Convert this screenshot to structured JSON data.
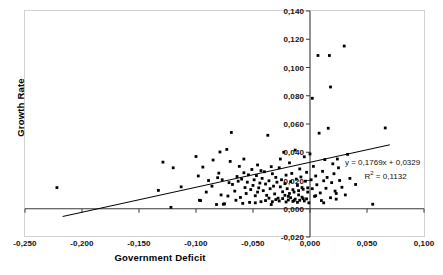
{
  "chart_data": {
    "type": "scatter",
    "title": "",
    "xlabel": "Government Deficit",
    "ylabel": "Growth Rate",
    "xlim": [
      -0.25,
      0.1
    ],
    "ylim": [
      -0.02,
      0.14
    ],
    "grid": false,
    "legend": "none",
    "x_ticks": [
      "-0,250",
      "-0,200",
      "-0,150",
      "-0,100",
      "-0,050",
      "0,000",
      "0,050",
      "0,100"
    ],
    "x_tick_values": [
      -0.25,
      -0.2,
      -0.15,
      -0.1,
      -0.05,
      0.0,
      0.05,
      0.1
    ],
    "y_ticks": [
      "0,140",
      "0,120",
      "0,100",
      "0,080",
      "0,060",
      "0,040",
      "0,020",
      "0,000",
      "-0,020"
    ],
    "y_tick_values": [
      0.14,
      0.12,
      0.1,
      0.08,
      0.06,
      0.04,
      0.02,
      0.0,
      -0.02
    ],
    "annotations": {
      "equation": "y = 0,1769x + 0,0329",
      "r_squared_prefix": "R",
      "r_squared_exp": "2",
      "r_squared_value": " = 0,1132"
    },
    "trendline": {
      "type": "linear",
      "slope": 0.1769,
      "intercept": 0.0329,
      "r2": 0.1132,
      "x_start": -0.217,
      "x_end": 0.07
    },
    "series": [
      {
        "name": "Countries",
        "marker": "square",
        "color": "#000000",
        "points": [
          [
            -0.222,
            0.015
          ],
          [
            -0.133,
            0.013
          ],
          [
            -0.129,
            0.033
          ],
          [
            -0.122,
            0.001
          ],
          [
            -0.12,
            0.029
          ],
          [
            -0.113,
            0.0155
          ],
          [
            -0.1,
            0.037
          ],
          [
            -0.098,
            0.0232
          ],
          [
            -0.097,
            0.006
          ],
          [
            -0.096,
            0.0058
          ],
          [
            -0.089,
            0.02
          ],
          [
            -0.086,
            0.016
          ],
          [
            -0.082,
            0.003
          ],
          [
            -0.081,
            0.022
          ],
          [
            -0.079,
            0.0402
          ],
          [
            -0.078,
            0.0098
          ],
          [
            -0.077,
            0.0205
          ],
          [
            -0.075,
            0.0035
          ],
          [
            -0.073,
            0.042
          ],
          [
            -0.072,
            0.009
          ],
          [
            -0.071,
            0.0185
          ],
          [
            -0.069,
            0.054
          ],
          [
            -0.068,
            0.0172
          ],
          [
            -0.066,
            0.0125
          ],
          [
            -0.065,
            0.006
          ],
          [
            -0.063,
            0.0195
          ],
          [
            -0.062,
            0.03
          ],
          [
            -0.061,
            0.008
          ],
          [
            -0.06,
            0.021
          ],
          [
            -0.059,
            0.0038
          ],
          [
            -0.058,
            0.0255
          ],
          [
            -0.057,
            0.015
          ],
          [
            -0.056,
            0.0108
          ],
          [
            -0.055,
            0.0188
          ],
          [
            -0.054,
            0.024
          ],
          [
            -0.053,
            0.0045
          ],
          [
            -0.052,
            0.0136
          ],
          [
            -0.051,
            0.0278
          ],
          [
            -0.05,
            0.0165
          ],
          [
            -0.049,
            0.0205
          ],
          [
            -0.048,
            0.0092
          ],
          [
            -0.047,
            0.0235
          ],
          [
            -0.046,
            0.031
          ],
          [
            -0.045,
            0.0148
          ],
          [
            -0.044,
            0.0182
          ],
          [
            -0.043,
            0.005
          ],
          [
            -0.042,
            0.0215
          ],
          [
            -0.041,
            0.0128
          ],
          [
            -0.04,
            0.0262
          ],
          [
            -0.039,
            0.0175
          ],
          [
            -0.038,
            0.0095
          ],
          [
            -0.037,
            0.052
          ],
          [
            -0.036,
            0.0198
          ],
          [
            -0.035,
            0.0142
          ],
          [
            -0.034,
            0.003
          ],
          [
            -0.033,
            0.0248
          ],
          [
            -0.032,
            0.016
          ],
          [
            -0.031,
            0.0105
          ],
          [
            -0.03,
            0.0222
          ],
          [
            -0.029,
            0.0188
          ],
          [
            -0.028,
            0.0075
          ],
          [
            -0.027,
            0.029
          ],
          [
            -0.026,
            0.0155
          ],
          [
            -0.025,
            0.0205
          ],
          [
            -0.024,
            0.012
          ],
          [
            -0.023,
            0.04
          ],
          [
            -0.022,
            0.0178
          ],
          [
            -0.021,
            0.0238
          ],
          [
            -0.02,
            0.0142
          ],
          [
            -0.019,
            0.0088
          ],
          [
            -0.018,
            0.0325
          ],
          [
            -0.017,
            0.0192
          ],
          [
            -0.016,
            0.025
          ],
          [
            -0.015,
            0.0135
          ],
          [
            -0.014,
            0.0058
          ],
          [
            -0.013,
            0.0415
          ],
          [
            -0.012,
            0.021
          ],
          [
            -0.011,
            0.0165
          ],
          [
            -0.01,
            0.0098
          ],
          [
            -0.009,
            0.0282
          ],
          [
            -0.008,
            0.0225
          ],
          [
            -0.007,
            0.015
          ],
          [
            -0.006,
            0.0072
          ],
          [
            -0.005,
            0.0368
          ],
          [
            -0.004,
            0.0195
          ],
          [
            -0.003,
            0.0258
          ],
          [
            -0.002,
            0.0118
          ],
          [
            -0.001,
            0.0042
          ],
          [
            0.0,
            0.0388
          ],
          [
            0.001,
            0.0205
          ],
          [
            0.002,
            0.0142
          ],
          [
            0.003,
            0.03
          ],
          [
            0.004,
            0.0088
          ],
          [
            0.005,
            0.0232
          ],
          [
            0.006,
            0.017
          ],
          [
            0.007,
            0.1085
          ],
          [
            0.008,
            0.0535
          ],
          [
            0.009,
            0.0112
          ],
          [
            0.01,
            0.0058
          ],
          [
            0.011,
            0.0265
          ],
          [
            0.012,
            0.0198
          ],
          [
            0.013,
            0.0348
          ],
          [
            0.014,
            0.0145
          ],
          [
            0.015,
            0.0222
          ],
          [
            0.016,
            0.057
          ],
          [
            0.017,
            0.1085
          ],
          [
            0.018,
            0.0862
          ],
          [
            0.019,
            0.0185
          ],
          [
            0.02,
            0.0318
          ],
          [
            0.021,
            0.0248
          ],
          [
            0.022,
            0.0125
          ],
          [
            0.023,
            0.0068
          ],
          [
            0.024,
            0.0352
          ],
          [
            0.025,
            0.029
          ],
          [
            0.026,
            0.02
          ],
          [
            0.028,
            0.0152
          ],
          [
            0.03,
            0.1152
          ],
          [
            0.031,
            0.0098
          ],
          [
            0.033,
            0.0385
          ],
          [
            0.035,
            0.0215
          ],
          [
            0.04,
            0.0172
          ],
          [
            0.055,
            0.0032
          ],
          [
            0.066,
            0.0572
          ],
          [
            -0.094,
            0.0295
          ],
          [
            -0.091,
            0.0118
          ],
          [
            -0.085,
            0.0345
          ],
          [
            -0.08,
            0.0252
          ],
          [
            -0.076,
            0.0032
          ],
          [
            -0.07,
            0.0335
          ],
          [
            -0.064,
            0.0228
          ],
          [
            -0.048,
            0.0042
          ],
          [
            -0.043,
            0.027
          ],
          [
            -0.039,
            0.0058
          ],
          [
            -0.036,
            0.0075
          ],
          [
            -0.033,
            0.005
          ],
          [
            -0.03,
            0.0065
          ],
          [
            -0.027,
            0.0055
          ],
          [
            -0.024,
            0.0072
          ],
          [
            -0.021,
            0.0048
          ],
          [
            -0.019,
            0.0062
          ],
          [
            -0.017,
            0.0078
          ],
          [
            -0.015,
            0.0052
          ],
          [
            -0.013,
            0.0068
          ],
          [
            -0.011,
            0.0045
          ],
          [
            -0.009,
            0.006
          ],
          [
            -0.007,
            0.0082
          ],
          [
            -0.005,
            0.0055
          ],
          [
            -0.003,
            0.007
          ],
          [
            0.002,
            0.0782
          ],
          [
            0.005,
            0.0092
          ],
          [
            0.012,
            0.0042
          ],
          [
            0.018,
            0.0078
          ],
          [
            0.023,
            0.0108
          ],
          [
            -0.058,
            0.0352
          ],
          [
            -0.046,
            0.0118
          ],
          [
            -0.034,
            0.0298
          ],
          [
            -0.026,
            0.0352
          ],
          [
            -0.022,
            0.0095
          ],
          [
            -0.018,
            0.0108
          ],
          [
            -0.014,
            0.0118
          ],
          [
            -0.01,
            0.0128
          ],
          [
            -0.006,
            0.0138
          ],
          [
            -0.002,
            0.0148
          ]
        ]
      }
    ]
  }
}
